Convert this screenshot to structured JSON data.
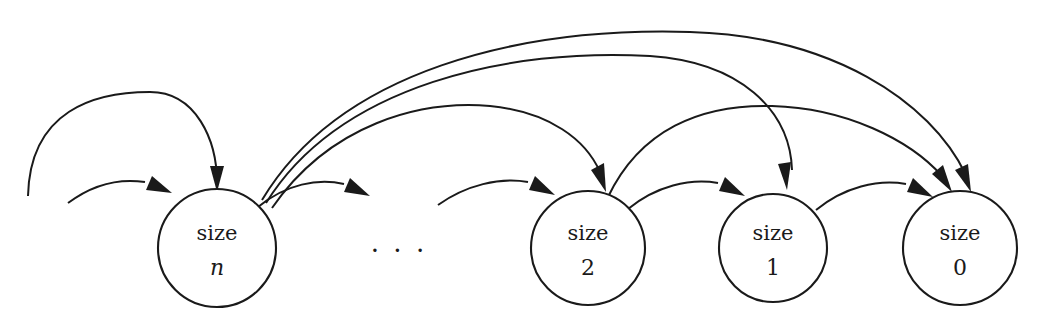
{
  "diagram": {
    "background_color": "#ffffff",
    "stroke_color": "#1a1a1a",
    "ellipsis": ". . .",
    "nodes": [
      {
        "id": "n",
        "line1": "size",
        "line2": "n",
        "italic": true,
        "cx": 217,
        "cy": 248,
        "r": 59
      },
      {
        "id": "s2",
        "line1": "size",
        "line2": "2",
        "italic": false,
        "cx": 588,
        "cy": 248,
        "r": 57
      },
      {
        "id": "s1",
        "line1": "size",
        "line2": "1",
        "italic": false,
        "cx": 773,
        "cy": 248,
        "r": 54
      },
      {
        "id": "s0",
        "line1": "size",
        "line2": "0",
        "italic": false,
        "cx": 960,
        "cy": 248,
        "r": 57
      }
    ],
    "edges": [
      {
        "name": "edge-into-size-n-outer",
        "from": "left-off-graph",
        "to": "n"
      },
      {
        "name": "edge-into-size-n-inner",
        "from": "left-off-graph",
        "to": "n"
      },
      {
        "name": "edge-size-n-to-ellipsis",
        "from": "n",
        "to": "ellipsis"
      },
      {
        "name": "edge-size-n-to-size-2",
        "from": "n",
        "to": "s2"
      },
      {
        "name": "edge-size-n-to-size-1",
        "from": "n",
        "to": "s1"
      },
      {
        "name": "edge-size-n-to-size-0",
        "from": "n",
        "to": "s0"
      },
      {
        "name": "edge-ellipsis-to-size-2",
        "from": "ellipsis",
        "to": "s2"
      },
      {
        "name": "edge-size-2-to-size-1",
        "from": "s2",
        "to": "s1"
      },
      {
        "name": "edge-size-2-to-size-0",
        "from": "s2",
        "to": "s0"
      },
      {
        "name": "edge-size-1-to-size-0",
        "from": "s1",
        "to": "s0"
      }
    ]
  }
}
